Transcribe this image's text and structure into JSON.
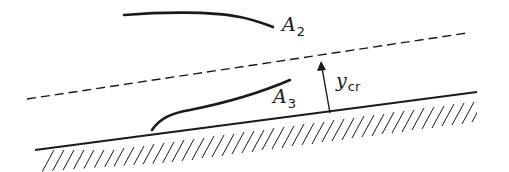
{
  "diagram": {
    "type": "open-channel water surface profiles on steep slope",
    "labels": {
      "a2": {
        "main": "A",
        "sub": "2"
      },
      "a3": {
        "main": "A",
        "sub": "3"
      },
      "ycr": {
        "main": "y",
        "sub": "cr"
      }
    },
    "elements": {
      "critical_depth_line": "dashed",
      "channel_bed": "hatched",
      "depth_arrow": "y_cr"
    },
    "colors": {
      "ink": "#1a1a1a",
      "background": "#ffffff"
    }
  }
}
